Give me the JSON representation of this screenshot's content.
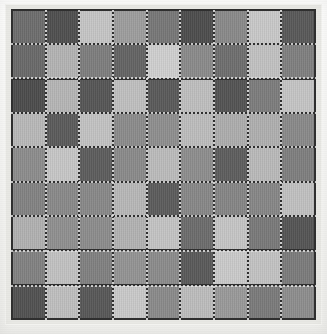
{
  "figure": {
    "kind": "grayscale-checkerboard-grid",
    "rows": 9,
    "cols": 9,
    "background_color": "#f6f6f4",
    "frame_color": "#e9e9e5",
    "gridline_color": "#2f2f2f",
    "gridline_highlight_color": "#ebebeb"
  },
  "chart_data": {
    "type": "heatmap",
    "title": "",
    "xlabel": "",
    "ylabel": "",
    "rows": 9,
    "cols": 9,
    "colormap": "grayscale",
    "value_range": [
      60,
      210
    ],
    "grid": true,
    "legend": "none",
    "colors": [
      [
        "#6e6e6e",
        "#4f4f4f",
        "#c6c6c6",
        "#9e9e9e",
        "#787878",
        "#4d4d4d",
        "#8a8a8a",
        "#c9c9c9",
        "#595959"
      ],
      [
        "#6a6a6a",
        "#b4b4b4",
        "#7e7e7e",
        "#646464",
        "#d0d0d0",
        "#8b8b8b",
        "#6f6f6f",
        "#c2c2c2",
        "#808080"
      ],
      [
        "#4c4c4c",
        "#b6b6b6",
        "#565656",
        "#c0c0c0",
        "#5a5a5a",
        "#bfbfbf",
        "#545454",
        "#7d7d7d",
        "#c5c5c5"
      ],
      [
        "#b9b9b9",
        "#5b5b5b",
        "#c3c3c3",
        "#8c8c8c",
        "#8f8f8f",
        "#bdbdbd",
        "#aeaeae",
        "#b0b0b0",
        "#8a8a8a"
      ],
      [
        "#8d8d8d",
        "#c7c7c7",
        "#5d5d5d",
        "#8b8b8b",
        "#bcbcbc",
        "#8e8e8e",
        "#5e5e5e",
        "#bababa",
        "#7f7f7f"
      ],
      [
        "#838383",
        "#8a8a8a",
        "#898989",
        "#b8b8b8",
        "#5c5c5c",
        "#888888",
        "#868686",
        "#878787",
        "#c1c1c1"
      ],
      [
        "#b2b2b2",
        "#909090",
        "#8d8d8d",
        "#b3b3b3",
        "#c4c4c4",
        "#6d6d6d",
        "#c6c6c6",
        "#7a7a7a",
        "#555555"
      ],
      [
        "#828282",
        "#c2c2c2",
        "#818181",
        "#949494",
        "#8c8c8c",
        "#5a5a5a",
        "#cbcbcb",
        "#c3c3c3",
        "#7c7c7c"
      ],
      [
        "#525252",
        "#bfbfbf",
        "#585858",
        "#cacaca",
        "#8b8b8b",
        "#bdbdbd",
        "#9a9a9a",
        "#7b7b7b",
        "#8e8e8e"
      ]
    ],
    "values": [
      [
        110,
        79,
        198,
        158,
        120,
        77,
        138,
        201,
        89
      ],
      [
        106,
        180,
        126,
        100,
        208,
        139,
        111,
        194,
        128
      ],
      [
        76,
        182,
        86,
        192,
        90,
        191,
        84,
        125,
        197
      ],
      [
        185,
        91,
        195,
        140,
        143,
        189,
        174,
        176,
        138
      ],
      [
        141,
        199,
        93,
        139,
        188,
        142,
        94,
        186,
        127
      ],
      [
        131,
        138,
        137,
        184,
        92,
        136,
        134,
        135,
        193
      ],
      [
        178,
        144,
        141,
        179,
        196,
        109,
        198,
        122,
        85
      ],
      [
        130,
        194,
        129,
        148,
        140,
        90,
        203,
        195,
        124
      ],
      [
        82,
        191,
        88,
        202,
        139,
        189,
        154,
        123,
        142
      ]
    ]
  }
}
